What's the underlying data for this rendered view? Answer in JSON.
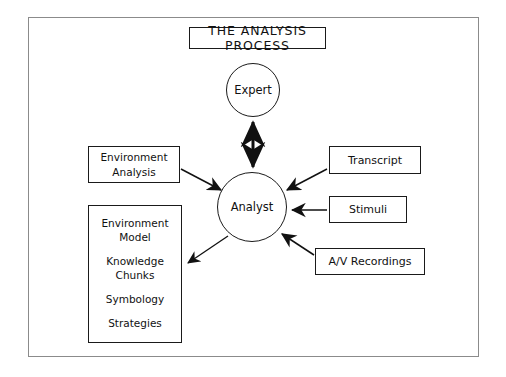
{
  "diagram": {
    "title": "THE ANALYSIS PROCESS",
    "nodes": {
      "expert": "Expert",
      "analyst": "Analyst",
      "environment_analysis_line1": "Environment",
      "environment_analysis_line2": "Analysis",
      "transcript": "Transcript",
      "stimuli": "Stimuli",
      "av_recordings": "A/V Recordings"
    },
    "model_list": [
      "Environment\nModel",
      "Knowledge\nChunks",
      "Symbology",
      "Strategies"
    ],
    "model_list_items": {
      "item0_line1": "Environment",
      "item0_line2": "Model",
      "item1_line1": "Knowledge",
      "item1_line2": "Chunks",
      "item2": "Symbology",
      "item3": "Strategies"
    },
    "colors": {
      "stroke": "#1a1a1a",
      "frame": "#8b8b8b",
      "background": "#ffffff",
      "text": "#111111"
    },
    "edges": [
      {
        "name": "expert-analyst",
        "from": "Expert",
        "to": "Analyst",
        "arrowheads": "both"
      },
      {
        "name": "environment-analysis-analyst",
        "from": "Environment Analysis",
        "to": "Analyst",
        "arrowheads": "to"
      },
      {
        "name": "analyst-environment-model",
        "from": "Analyst",
        "to": "Environment Model",
        "arrowheads": "to"
      },
      {
        "name": "transcript-analyst",
        "from": "Transcript",
        "to": "Analyst",
        "arrowheads": "to"
      },
      {
        "name": "stimuli-analyst",
        "from": "Stimuli",
        "to": "Analyst",
        "arrowheads": "to"
      },
      {
        "name": "av-recordings-analyst",
        "from": "A/V Recordings",
        "to": "Analyst",
        "arrowheads": "to"
      }
    ]
  }
}
